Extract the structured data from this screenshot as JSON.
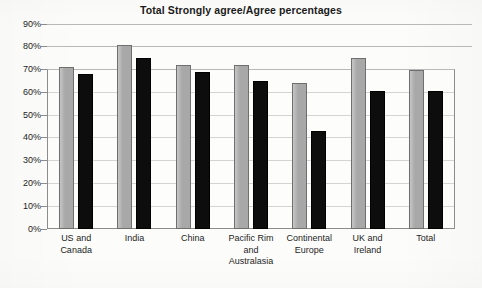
{
  "chart_data": {
    "type": "bar",
    "title": "Total Strongly agree/Agree percentages",
    "xlabel": "",
    "ylabel": "",
    "ylim": [
      0,
      90
    ],
    "ytick_step": 10,
    "grid": true,
    "legend": "none",
    "categories": [
      "US and Canada",
      "India",
      "China",
      "Pacific Rim and Australasia",
      "Continental Europe",
      "UK and Ireland",
      "Total"
    ],
    "category_lines": [
      [
        "US and",
        "Canada"
      ],
      [
        "India"
      ],
      [
        "China"
      ],
      [
        "Pacific Rim",
        "and",
        "Australasia"
      ],
      [
        "Continental",
        "Europe"
      ],
      [
        "UK and",
        "Ireland"
      ],
      [
        "Total"
      ]
    ],
    "ytick_labels": [
      "90%",
      "80%",
      "70%",
      "60%",
      "50%",
      "40%",
      "30%",
      "20%",
      "10%",
      "0%"
    ],
    "ytick_values": [
      90,
      80,
      70,
      60,
      50,
      40,
      30,
      20,
      10,
      0
    ],
    "series": [
      {
        "name": "Series 1",
        "color": "#a8a8a8",
        "values": [
          71,
          81,
          72,
          72,
          64,
          75,
          70
        ]
      },
      {
        "name": "Series 2",
        "color": "#0d0d0d",
        "values": [
          68,
          75,
          69,
          65,
          43,
          60.5,
          60.5
        ]
      }
    ],
    "colors": {
      "series1_fill": "#a8a8a8",
      "series1_stroke": "#6f6f6f",
      "series2_fill": "#0d0d0d",
      "series2_stroke": "#000000",
      "gridline": "#bdbdbd",
      "axis": "#8c8c8c",
      "background": "#fcfcfa",
      "text": "#1e1e1e"
    }
  }
}
